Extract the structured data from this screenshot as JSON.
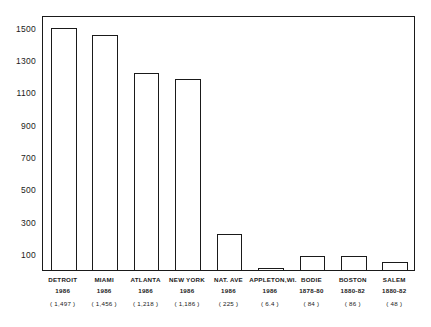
{
  "chart_data": {
    "type": "bar",
    "title": "",
    "subtitle": "",
    "xlabel": "",
    "ylabel": "",
    "ylim": [
      0,
      1580
    ],
    "grid": false,
    "legend": null,
    "y_ticks": [
      100,
      300,
      500,
      700,
      900,
      1100,
      1300,
      1500
    ],
    "y_tick_labels": [
      "100",
      "300",
      "500",
      "700",
      "900",
      "1100",
      "1300",
      "1500"
    ],
    "categories": [
      "DETROIT",
      "MIAMI",
      "ATLANTA",
      "NEW YORK",
      "NAT. AVE",
      "APPLETON,WI.",
      "BODIE",
      "BOSTON",
      "SALEM"
    ],
    "values": [
      1497,
      1456,
      1218,
      1186,
      225,
      6.4,
      84,
      86,
      48
    ],
    "bars": [
      {
        "name": "DETROIT",
        "year": "1986",
        "value": 1497,
        "value_label": "( 1,497 )"
      },
      {
        "name": "MIAMI",
        "year": "1986",
        "value": 1456,
        "value_label": "( 1,456 )"
      },
      {
        "name": "ATLANTA",
        "year": "1986",
        "value": 1218,
        "value_label": "( 1,218 )"
      },
      {
        "name": "NEW YORK",
        "year": "1986",
        "value": 1186,
        "value_label": "( 1,186 )"
      },
      {
        "name": "NAT. AVE",
        "year": "1986",
        "value": 225,
        "value_label": "( 225 )"
      },
      {
        "name": "APPLETON,WI.",
        "year": "1986",
        "value": 6.4,
        "value_label": "( 6.4 )"
      },
      {
        "name": "BODIE",
        "year": "1878-80",
        "value": 84,
        "value_label": "( 84 )"
      },
      {
        "name": "BOSTON",
        "year": "1880-82",
        "value": 86,
        "value_label": "( 86 )"
      },
      {
        "name": "SALEM",
        "year": "1880-82",
        "value": 48,
        "value_label": "( 48 )"
      }
    ],
    "colors": {
      "bar_fill": "#ffffff",
      "bar_outline": "#1a1a1a",
      "axis": "#1a1a1a",
      "text": "#1a1a1a",
      "background": "#ffffff"
    }
  }
}
